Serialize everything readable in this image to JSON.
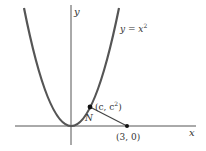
{
  "diagram": {
    "axes": {
      "x_label": "x",
      "y_label": "y"
    },
    "curve": {
      "label_lhs": "y = x",
      "label_exp": "2"
    },
    "point_on_curve": {
      "label_pre": "(c, c",
      "label_exp": "2",
      "label_post": ")"
    },
    "point_on_axis": {
      "label": "(3, 0)"
    },
    "segment_label": "N",
    "colors": {
      "curve": "#555555",
      "axis": "#444444",
      "segment": "#333333"
    }
  }
}
